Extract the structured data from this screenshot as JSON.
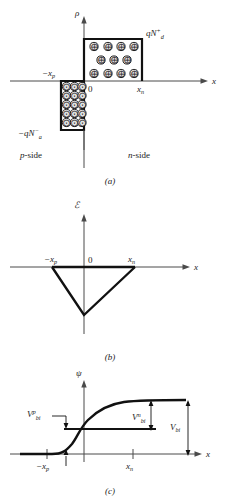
{
  "figure": {
    "panels": [
      {
        "letter": "(a)",
        "quantity": "ρ",
        "y_axis_label": "ρ",
        "x_axis_label": "x",
        "origin_label": "0",
        "tick_labels": [
          "−x",
          "p",
          "x",
          "n"
        ],
        "left_tick": "−x",
        "left_tick_sub": "p",
        "right_tick": "x",
        "right_tick_sub": "n",
        "positive_block_label": {
          "base": "qN",
          "sub": "d",
          "sup": "+"
        },
        "negative_block_label": {
          "base": "−qN",
          "sub": "a",
          "sup": "−"
        },
        "region_left_label": {
          "italic": "p",
          "rest": "-side"
        },
        "region_right_label": {
          "italic": "n",
          "rest": "-side"
        },
        "positive_charge_glyph": "⊕",
        "negative_charge_glyph": "⊖",
        "positive_rows": [
          4,
          3,
          4
        ],
        "negative_rows": [
          3,
          3,
          3,
          3,
          3
        ]
      },
      {
        "letter": "(b)",
        "quantity": "ℰ",
        "y_axis_label": "ℰ",
        "x_axis_label": "x",
        "origin_label": "0",
        "left_tick": "−x",
        "left_tick_sub": "p",
        "right_tick": "x",
        "right_tick_sub": "n",
        "shape": "triangular-dip",
        "peak_sign": "negative"
      },
      {
        "letter": "(c)",
        "quantity": "ψ",
        "y_axis_label": "ψ",
        "x_axis_label": "x",
        "left_tick": "−x",
        "left_tick_sub": "p",
        "right_tick": "x",
        "right_tick_sub": "n",
        "annotations": [
          {
            "base": "V",
            "sub": "bi",
            "sup": "p"
          },
          {
            "base": "V",
            "sub": "bi",
            "sup": "n"
          },
          {
            "base": "V",
            "sub": "bi",
            "sup": ""
          }
        ],
        "shape": "sigmoid-step"
      }
    ],
    "colors": {
      "line": "#111111",
      "axis": "#4a4a4a",
      "charge_fill": "#e3e3e3",
      "background": "#ffffff"
    }
  }
}
